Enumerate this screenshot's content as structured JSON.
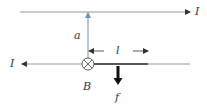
{
  "diagram": {
    "labels": {
      "top_current": "I",
      "bottom_current": "I",
      "distance": "a",
      "length": "l",
      "field": "B",
      "force": "f"
    },
    "colors": {
      "wire": "#9a9a9a",
      "distance_arrow": "#6b8fc7",
      "rod": "#222222",
      "force_arrow": "#111111",
      "text": "#333333"
    },
    "elements": [
      {
        "type": "wire",
        "name": "top-wire",
        "direction": "right",
        "current": "I"
      },
      {
        "type": "wire",
        "name": "bottom-wire",
        "direction": "left",
        "current": "I"
      },
      {
        "type": "rod",
        "name": "conducting-rod",
        "length_label": "l"
      },
      {
        "type": "field-symbol",
        "name": "magnetic-field-into-page",
        "label": "B"
      },
      {
        "type": "dimension",
        "name": "separation",
        "label": "a"
      },
      {
        "type": "force",
        "name": "force-on-rod",
        "direction": "down",
        "label": "f"
      }
    ]
  }
}
